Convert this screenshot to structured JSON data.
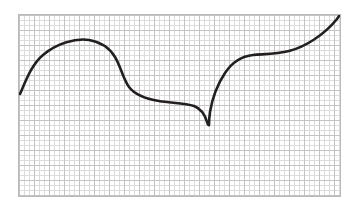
{
  "canvas": {
    "width": 357,
    "height": 211,
    "background_color": "#ffffff"
  },
  "plot": {
    "frame": {
      "x": 18,
      "y": 14,
      "width": 323,
      "height": 183
    },
    "frame_border_color": "#b9b9b9",
    "frame_background_color": "#ffffff"
  },
  "grid": {
    "minor_spacing_px": 5,
    "major_spacing_px": 15,
    "minor_color": "#dcdcdc",
    "major_color": "#c3c3c3",
    "visible": true
  },
  "chart_data": {
    "type": "line",
    "title": "",
    "subtitle": "",
    "xlabel": "",
    "ylabel": "",
    "xlim": [
      0,
      323
    ],
    "ylim": [
      183,
      0
    ],
    "grid": true,
    "legend": null,
    "annotations": [],
    "tick_labels": {
      "x": [],
      "y": []
    },
    "series": [
      {
        "name": "curve",
        "color": "#231f20",
        "line_width": 2.6,
        "style": "solid",
        "description": "Smooth hand-drawn curve: rises from lower-left to a rounded maximum, descends through an inflection to a near-flat plateau, plunges to a sharp downward cusp, then rises steeply to a second plateau and sweeps upward off the top-right corner.",
        "features": {
          "start_point": [
            19,
            93
          ],
          "maximum_point": [
            95,
            39
          ],
          "descent_inflection": [
            131,
            70
          ],
          "plateau_point": [
            176,
            101
          ],
          "cusp_point": [
            208,
            124
          ],
          "second_plateau_point": [
            252,
            55
          ],
          "end_point": [
            340,
            14
          ]
        },
        "path": "M 1 79 C 6 68 12 50 24 40 C 38 28 57 23 70 25 C 82 27 90 32 96 42 C 102 52 104 64 110 72 C 116 80 128 84 140 86 C 152 88 166 88 175 91 C 183 94 186 100 188 107 C 189 111 190 110 190 110 L 190 110 C 190 110 190 104 191 97 C 193 85 198 70 206 58 C 214 46 224 41 234 40 C 246 39 258 39 270 36 C 286 32 305 20 318 4 C 320 1 321 0 322 -1"
      }
    ]
  }
}
